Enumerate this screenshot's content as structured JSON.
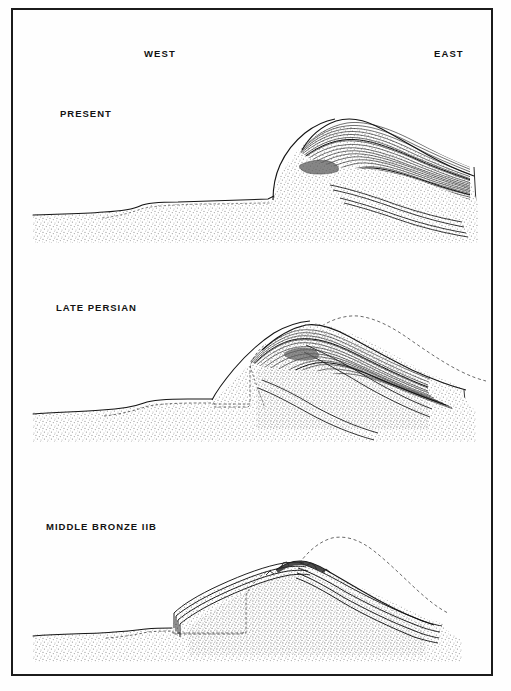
{
  "figure": {
    "type": "archaeological-tell-cross-sections",
    "orientation_labels": {
      "west": "WEST",
      "east": "EAST"
    },
    "frame_color": "#1b1b1b",
    "background_color": "#ffffff",
    "ink_color": "#111111",
    "fill_stipple_color": "#9a9a9a",
    "panels": [
      {
        "id": "present",
        "label": "PRESENT",
        "has_dashed_profile": false,
        "description": "Present-day mound profile with dense occupational strata capping the east slope"
      },
      {
        "id": "late-persian",
        "label": "LATE PERSIAN",
        "has_dashed_profile": true,
        "description": "Late Persian period mound with dashed present-day profile overlay"
      },
      {
        "id": "middle-bronze-iib",
        "label": "MIDDLE BRONZE IIB",
        "has_dashed_profile": true,
        "description": "Middle Bronze IIB rampart and glacis with dashed present-day profile overlay"
      }
    ]
  }
}
